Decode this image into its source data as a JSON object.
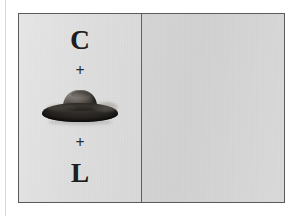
{
  "figure": {
    "background_color": "#d9d9d9",
    "border_color": "#5b5b5b",
    "left_panel": {
      "background_color": "#dcdcdc",
      "equation": {
        "term_top_label": "C",
        "operator_upper_label": "+",
        "object_name": "hat-illustration",
        "object_label": "hat",
        "operator_lower_label": "+",
        "term_bottom_label": "L"
      }
    },
    "right_panel": {
      "background_color": "#d6d6d6",
      "content": ""
    },
    "divider_color": "#5b5b5b"
  },
  "colors": {
    "hat_crown": "#6f6a63",
    "hat_brim": "#2b2825",
    "hat_band": "#24221f",
    "text": "#1e1e1e",
    "page_edge_rule": "#d8d8d8"
  }
}
